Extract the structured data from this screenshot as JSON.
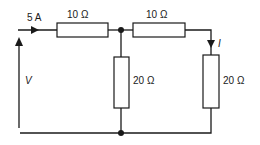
{
  "diagram": {
    "type": "circuit",
    "source_current": {
      "label": "5 A"
    },
    "voltage": {
      "label": "V"
    },
    "branch_current": {
      "label": "I"
    },
    "resistors": [
      {
        "id": "R1",
        "label": "10 Ω",
        "position": "top-left series"
      },
      {
        "id": "R2",
        "label": "10 Ω",
        "position": "top-right series"
      },
      {
        "id": "R3",
        "label": "20 Ω",
        "position": "middle shunt"
      },
      {
        "id": "R4",
        "label": "20 Ω",
        "position": "right shunt"
      }
    ],
    "colors": {
      "line": "#1a1a1a",
      "background": "#ffffff"
    }
  }
}
